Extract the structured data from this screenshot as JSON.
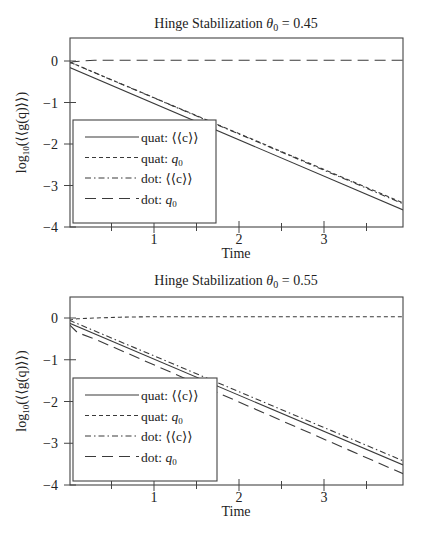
{
  "chart_data": [
    {
      "type": "line",
      "title": "Hinge Stabilization θ₀ = 0.45",
      "title_main": "Hinge Stabilization ",
      "title_symbol": "θ",
      "title_sub": "0",
      "title_value": " = 0.45",
      "xlabel": "Time",
      "ylabel": "log₁₀(⟨⟨g(q)⟩⟩)",
      "xlim": [
        0,
        3.93
      ],
      "ylim": [
        -4,
        0.55
      ],
      "xticks": [
        1,
        2,
        3
      ],
      "xticks_minor": [
        0.5,
        1.5,
        2.5,
        3.5
      ],
      "yticks": [
        0,
        -1,
        -2,
        -3,
        -4
      ],
      "grid": false,
      "legend_position": "lower left",
      "series": [
        {
          "name": "quat: ⟨⟨c⟩⟩",
          "style": "solid",
          "x": [
            0,
            3.93
          ],
          "values": [
            -0.15,
            -3.59
          ]
        },
        {
          "name": "quat: q₀",
          "style": "dashed",
          "x": [
            0,
            3.93
          ],
          "values": [
            -0.02,
            -3.42
          ]
        },
        {
          "name": "dot: ⟨⟨c⟩⟩",
          "style": "dashdot",
          "x": [
            0,
            3.93
          ],
          "values": [
            -0.02,
            -3.44
          ]
        },
        {
          "name": "dot: q₀",
          "style": "longdash",
          "x": [
            0,
            0.05,
            0.15,
            0.3,
            3.93
          ],
          "values": [
            -0.06,
            -0.02,
            0.0,
            0.02,
            0.02
          ]
        }
      ]
    },
    {
      "type": "line",
      "title": "Hinge Stabilization θ₀ = 0.55",
      "title_main": "Hinge Stabilization ",
      "title_symbol": "θ",
      "title_sub": "0",
      "title_value": " = 0.55",
      "xlabel": "Time",
      "ylabel": "log₁₀(⟨⟨g(q)⟩⟩)",
      "xlim": [
        0,
        3.93
      ],
      "ylim": [
        -4,
        0.5
      ],
      "xticks": [
        1,
        2,
        3
      ],
      "xticks_minor": [
        0.5,
        1.5,
        2.5,
        3.5
      ],
      "yticks": [
        0,
        -1,
        -2,
        -3,
        -4
      ],
      "grid": false,
      "legend_position": "lower left",
      "series": [
        {
          "name": "quat: ⟨⟨c⟩⟩",
          "style": "solid",
          "x": [
            0,
            3.93
          ],
          "values": [
            -0.12,
            -3.52
          ]
        },
        {
          "name": "quat: q₀",
          "style": "dashed",
          "x": [
            0,
            0.1,
            0.3,
            0.6,
            1.0,
            3.93
          ],
          "values": [
            -0.05,
            -0.02,
            0.0,
            0.02,
            0.03,
            0.03
          ]
        },
        {
          "name": "dot: ⟨⟨c⟩⟩",
          "style": "dashdot",
          "x": [
            0,
            3.93
          ],
          "values": [
            -0.05,
            -3.42
          ]
        },
        {
          "name": "dot: q₀",
          "style": "longdash",
          "x": [
            0,
            0.1,
            0.3,
            3.93
          ],
          "values": [
            -0.15,
            -0.35,
            -0.5,
            -3.73
          ]
        }
      ]
    }
  ],
  "legend_labels": {
    "quat_c_prefix": "quat: ",
    "quat_q0_prefix": "quat: ",
    "dot_c_prefix": "dot: ",
    "dot_q0_prefix": "dot: ",
    "c_symbol": "⟨⟨c⟩⟩",
    "q_symbol": "q",
    "q_sub": "0"
  },
  "axis_labels": {
    "x": "Time",
    "y_prefix": "log",
    "y_sub": "10",
    "y_body": "(⟨⟨g(q)⟩⟩)"
  },
  "tick_labels": {
    "x": [
      "1",
      "2",
      "3"
    ],
    "y": [
      "0",
      "−1",
      "−2",
      "−3",
      "−4"
    ]
  }
}
